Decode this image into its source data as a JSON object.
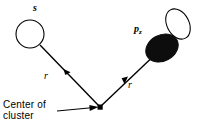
{
  "figure": {
    "width": 204,
    "height": 130,
    "background": "#ffffff",
    "ink": "#000000"
  },
  "labels": {
    "s_orbital": "s",
    "p_orbital_main": "p",
    "p_orbital_subscript": "z",
    "radius_left": "r",
    "radius_right": "r",
    "center_line1": "Center of",
    "center_line2": "cluster"
  },
  "geometry": {
    "center_node": {
      "x": 100,
      "y": 107,
      "size": 5
    },
    "s_orbital": {
      "cx": 30,
      "cy": 34,
      "r": 14,
      "fill": "none",
      "stroke": "#000000"
    },
    "p_orbital_filled_lobe": {
      "cx": 162,
      "cy": 48,
      "rx": 17,
      "ry": 13,
      "rotate": -28,
      "fill": "#0d0d0d"
    },
    "p_orbital_open_lobe": {
      "cx": 178,
      "cy": 24,
      "rx": 11,
      "ry": 16,
      "rotate": -28,
      "fill": "none",
      "stroke": "#000000"
    },
    "vector_left": {
      "x1": 100,
      "y1": 107,
      "x2": 40,
      "y2": 45
    },
    "vector_right": {
      "x1": 100,
      "y1": 107,
      "x2": 160,
      "y2": 50
    },
    "leader_line": {
      "x1": 57,
      "y1": 111,
      "x2": 95,
      "y2": 107
    }
  }
}
